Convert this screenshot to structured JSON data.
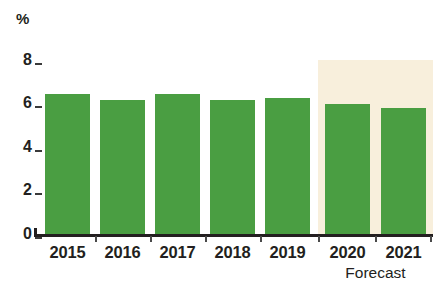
{
  "chart_data": {
    "type": "bar",
    "title": "",
    "subtitle": "",
    "xlabel": "",
    "ylabel": "%",
    "unit_label": "%",
    "categories": [
      "2015",
      "2016",
      "2017",
      "2018",
      "2019",
      "2020",
      "2021"
    ],
    "values": [
      6.45,
      6.15,
      6.45,
      6.15,
      6.25,
      6.0,
      5.8
    ],
    "series": [
      {
        "name": "Growth rate",
        "values": [
          6.45,
          6.15,
          6.45,
          6.15,
          6.25,
          6.0,
          5.8
        ],
        "color": "#4a9e42"
      }
    ],
    "ylim": [
      0,
      8
    ],
    "yticks": [
      0,
      2,
      4,
      6,
      8
    ],
    "ytick_labels": [
      "0",
      "2",
      "4",
      "6",
      "8"
    ],
    "grid": false,
    "legend": false,
    "legend_position": "none",
    "annotations": [
      {
        "text": "Forecast",
        "applies_to": [
          "2020",
          "2021"
        ],
        "style": "shaded-band",
        "band_color": "#f8efdc"
      }
    ],
    "colors": {
      "bar": "#4a9e42",
      "forecast_band": "#f8efdc",
      "axis": "#231f20",
      "text": "#231f20",
      "background": "#ffffff"
    }
  },
  "axis": {
    "unit": "%",
    "ticks": [
      {
        "label": "8",
        "value": 8
      },
      {
        "label": "6",
        "value": 6
      },
      {
        "label": "4",
        "value": 4
      },
      {
        "label": "2",
        "value": 2
      },
      {
        "label": "0",
        "value": 0
      }
    ]
  },
  "categories": [
    {
      "label": "2015"
    },
    {
      "label": "2016"
    },
    {
      "label": "2017"
    },
    {
      "label": "2018"
    },
    {
      "label": "2019"
    },
    {
      "label": "2020"
    },
    {
      "label": "2021"
    }
  ],
  "forecast": {
    "caption": "Forecast"
  }
}
